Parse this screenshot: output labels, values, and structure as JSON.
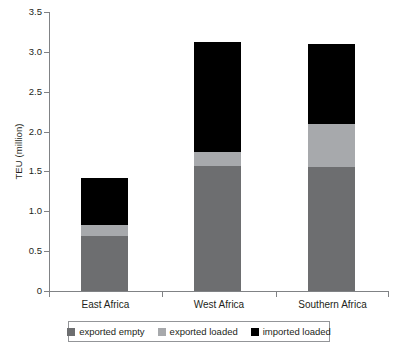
{
  "chart_data": {
    "type": "bar",
    "stacked": true,
    "title": "",
    "xlabel": "",
    "ylabel": "TEU (million)",
    "ylim": [
      0,
      3.5
    ],
    "yticks": [
      "0",
      "0.5",
      "1.0",
      "1.5",
      "2.0",
      "2.5",
      "3.0",
      "3.5"
    ],
    "ytick_values": [
      0,
      0.5,
      1.0,
      1.5,
      2.0,
      2.5,
      3.0,
      3.5
    ],
    "grid": false,
    "legend_position": "bottom",
    "categories": [
      "East Africa",
      "West Africa",
      "Southern Africa"
    ],
    "series": [
      {
        "name": "exported empty",
        "color": "#6d6e70",
        "values": [
          0.69,
          1.57,
          1.56
        ]
      },
      {
        "name": "exported loaded",
        "color": "#a7a9ac",
        "values": [
          0.14,
          0.18,
          0.53
        ]
      },
      {
        "name": "imported loaded",
        "color": "#000000",
        "values": [
          0.59,
          1.38,
          1.01
        ]
      }
    ],
    "totals": [
      1.42,
      3.13,
      3.1
    ]
  },
  "axis": {
    "y_title": "TEU (million)"
  },
  "legend": {
    "items": [
      {
        "label": "exported empty",
        "color": "#6d6e70"
      },
      {
        "label": "exported loaded",
        "color": "#a7a9ac"
      },
      {
        "label": "imported loaded",
        "color": "#000000"
      }
    ]
  }
}
